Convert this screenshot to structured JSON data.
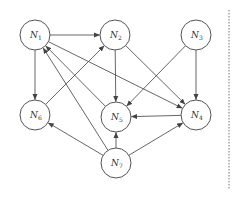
{
  "diagram": {
    "type": "directed-graph",
    "colors": {
      "stroke": "#555555",
      "node_fill": "#ffffff",
      "text": "#333333",
      "divider": "#777777"
    },
    "node_radius": 15,
    "nodes": [
      {
        "id": "N1",
        "base": "N",
        "sub": "1",
        "x": 35,
        "y": 35
      },
      {
        "id": "N2",
        "base": "N",
        "sub": "2",
        "x": 115,
        "y": 35
      },
      {
        "id": "N3",
        "base": "N",
        "sub": "3",
        "x": 196,
        "y": 35
      },
      {
        "id": "N6",
        "base": "N",
        "sub": "6",
        "x": 35,
        "y": 115
      },
      {
        "id": "N5",
        "base": "N",
        "sub": "5",
        "x": 116,
        "y": 117
      },
      {
        "id": "N4",
        "base": "N",
        "sub": "4",
        "x": 196,
        "y": 115
      },
      {
        "id": "N7",
        "base": "N",
        "sub": "7",
        "x": 116,
        "y": 163
      }
    ],
    "edges": [
      {
        "from": "N1",
        "to": "N2"
      },
      {
        "from": "N1",
        "to": "N6"
      },
      {
        "from": "N1",
        "to": "N4"
      },
      {
        "from": "N6",
        "to": "N2"
      },
      {
        "from": "N2",
        "to": "N5"
      },
      {
        "from": "N2",
        "to": "N4"
      },
      {
        "from": "N3",
        "to": "N5"
      },
      {
        "from": "N3",
        "to": "N4"
      },
      {
        "from": "N5",
        "to": "N1"
      },
      {
        "from": "N4",
        "to": "N5"
      },
      {
        "from": "N7",
        "to": "N1"
      },
      {
        "from": "N7",
        "to": "N6"
      },
      {
        "from": "N7",
        "to": "N5"
      },
      {
        "from": "N7",
        "to": "N4"
      }
    ],
    "divider": {
      "x": 229,
      "y1": 10,
      "y2": 190,
      "style": "dotted"
    }
  }
}
